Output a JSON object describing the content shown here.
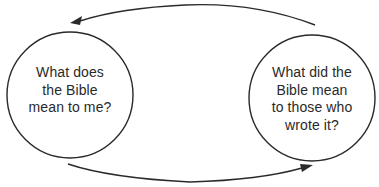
{
  "diagram": {
    "type": "cycle",
    "colors": {
      "stroke": "#2a2a2a",
      "text": "#2a2a2a",
      "background": "#ffffff"
    },
    "nodes": [
      {
        "id": "present-meaning",
        "lines": [
          "What does",
          "the Bible",
          "mean to me?"
        ]
      },
      {
        "id": "original-meaning",
        "lines": [
          "What did the",
          "Bible mean",
          "to those who",
          "wrote it?"
        ]
      }
    ],
    "edges": [
      {
        "from": "original-meaning",
        "to": "present-meaning",
        "position": "top",
        "direction": "right-to-left"
      },
      {
        "from": "present-meaning",
        "to": "original-meaning",
        "position": "bottom",
        "direction": "left-to-right"
      }
    ]
  }
}
